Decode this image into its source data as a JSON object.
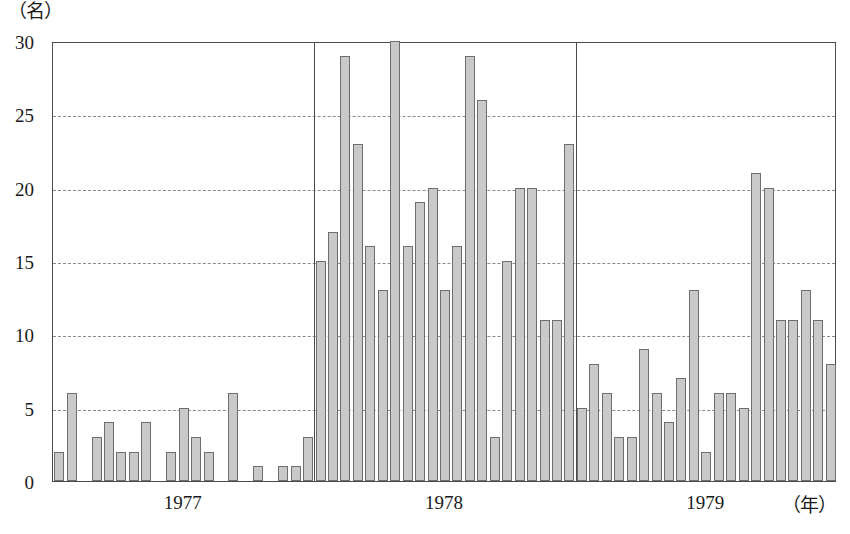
{
  "chart_data": {
    "type": "bar",
    "title": "",
    "xlabel": "（年）",
    "ylabel": "（名）",
    "ylim": [
      0,
      30
    ],
    "yticks": [
      0,
      5,
      10,
      15,
      20,
      25,
      30
    ],
    "grid": true,
    "legend": null,
    "xtick_labels": [
      "1977",
      "1978",
      "1979"
    ],
    "year_groups": [
      {
        "year": "1977",
        "values": [
          2,
          6,
          null,
          3,
          4,
          2,
          2,
          4,
          null,
          2,
          5,
          3,
          2,
          null,
          6,
          null,
          1,
          null,
          1,
          1,
          3
        ]
      },
      {
        "year": "1978",
        "values": [
          15,
          17,
          29,
          23,
          16,
          13,
          30,
          16,
          19,
          20,
          13,
          16,
          29,
          26,
          3,
          15,
          20,
          20,
          11,
          11,
          23
        ]
      },
      {
        "year": "1979",
        "values": [
          5,
          8,
          6,
          3,
          3,
          9,
          6,
          4,
          7,
          13,
          2,
          6,
          6,
          5,
          21,
          20,
          11,
          11,
          13,
          11,
          8
        ]
      }
    ]
  },
  "axes": {
    "y_unit": "（名）",
    "x_unit": "（年）",
    "y_tick_labels": [
      "30",
      "25",
      "20",
      "15",
      "10",
      "5",
      "0"
    ]
  }
}
